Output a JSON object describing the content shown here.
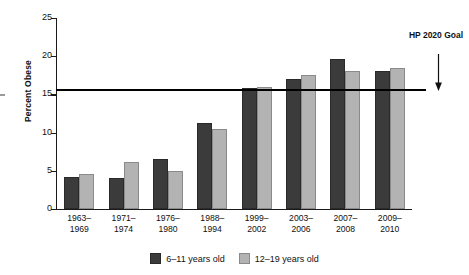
{
  "chart_data": {
    "type": "bar",
    "title": "",
    "xlabel": "",
    "ylabel": "Percent Obese",
    "ylim": [
      0,
      25
    ],
    "yticks": [
      0,
      5,
      10,
      15,
      20,
      25
    ],
    "ytick_labels": [
      "0",
      "5",
      "10",
      "15",
      "20",
      "25"
    ],
    "grid": false,
    "legend_position": "bottom-center",
    "categories": [
      "1963–1969",
      "1971–1974",
      "1976–1980",
      "1988–1994",
      "1999–2002",
      "2003–2006",
      "2007–2008",
      "2009–2010"
    ],
    "category_lines": [
      [
        "1963–",
        "1969"
      ],
      [
        "1971–",
        "1974"
      ],
      [
        "1976–",
        "1980"
      ],
      [
        "1988–",
        "1994"
      ],
      [
        "1999–",
        "2002"
      ],
      [
        "2003–",
        "2006"
      ],
      [
        "2007–",
        "2008"
      ],
      [
        "2009–",
        "2010"
      ]
    ],
    "series": [
      {
        "name": "6–11 years old",
        "color": "#3b3b3b",
        "values": [
          4.2,
          4.0,
          6.5,
          11.3,
          15.8,
          17.0,
          19.6,
          18.0
        ]
      },
      {
        "name": "12–19 years old",
        "color": "#b3b3b3",
        "values": [
          4.6,
          6.1,
          5.0,
          10.5,
          16.0,
          17.6,
          18.1,
          18.4
        ]
      }
    ],
    "reference_line": {
      "label": "HP 2020 Goal",
      "label_lines": [
        "HP 2020",
        "Goal"
      ],
      "value": 15.7,
      "color": "#000000"
    }
  }
}
